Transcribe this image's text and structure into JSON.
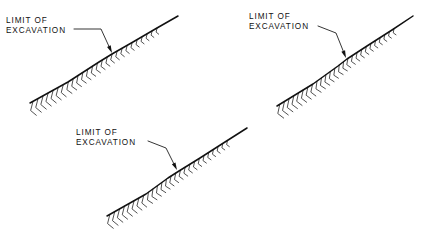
{
  "drawing": {
    "type": "engineering-cross-section",
    "description": "Three slope cross-section details showing limit of excavation",
    "colors": {
      "background": "#ffffff",
      "line": "#111111",
      "hatch": "#333333",
      "text": "#111111"
    },
    "figures": [
      {
        "id": "figure-1",
        "label": {
          "line1": "LIMIT OF",
          "line2": "EXCAVATION",
          "x": 6,
          "y": 23
        },
        "leader": {
          "start_x": 74,
          "start_y": 29,
          "elbow_x": 101,
          "elbow_y": 29,
          "tip_x": 112,
          "tip_y": 53,
          "arrow_angle": 66
        },
        "ground_path": "M 30 103 L 68 82 L 99 62 L 112 54 L 133 42 L 157 28 L 178 16",
        "hatch_start_t": 0.02,
        "hatch_end_t": 0.86,
        "hatch_count": 26
      },
      {
        "id": "figure-2",
        "label": {
          "line1": "LIMIT OF",
          "line2": "EXCAVATION",
          "x": 249,
          "y": 19
        },
        "leader": {
          "start_x": 318,
          "start_y": 26,
          "elbow_x": 336,
          "elbow_y": 33,
          "tip_x": 346,
          "tip_y": 58,
          "arrow_angle": 70
        },
        "ground_path": "M 277 106 L 313 84 L 338 66 L 347 59 L 367 46 L 392 30 L 413 16",
        "hatch_start_t": 0.02,
        "hatch_end_t": 0.86,
        "hatch_count": 26
      },
      {
        "id": "figure-3",
        "label": {
          "line1": "LIMIT OF",
          "line2": "EXCAVATION",
          "x": 76,
          "y": 135
        },
        "leader": {
          "start_x": 148,
          "start_y": 141,
          "elbow_x": 166,
          "elbow_y": 148,
          "tip_x": 177,
          "tip_y": 170,
          "arrow_angle": 66
        },
        "ground_path": "M 107 216 L 146 194 L 168 178 L 179 171 L 200 158 L 225 142 L 247 128",
        "hatch_start_t": 0.02,
        "hatch_end_t": 0.86,
        "hatch_count": 26
      }
    ]
  }
}
